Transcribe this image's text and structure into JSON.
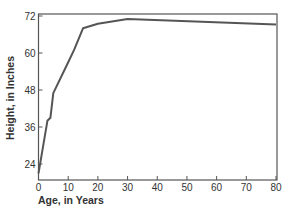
{
  "chart_data": {
    "type": "line",
    "title": "",
    "xlabel": "Age, in Years",
    "ylabel": "Height, in Inches",
    "xlim": [
      0,
      80
    ],
    "ylim": [
      19,
      72.5
    ],
    "xticks": [
      0,
      10,
      20,
      30,
      40,
      50,
      60,
      70,
      80
    ],
    "yticks": [
      24,
      36,
      48,
      60,
      72
    ],
    "grid": false,
    "legend": "none",
    "series": [
      {
        "name": "Height",
        "x": [
          0,
          3,
          4,
          5,
          10,
          12,
          15,
          20,
          30,
          80
        ],
        "y": [
          21,
          38,
          39,
          47,
          57,
          61,
          68,
          69.5,
          71,
          69.2
        ]
      }
    ],
    "colors": {
      "line": "#555555",
      "axis": "#555555",
      "text": "#333333"
    }
  }
}
